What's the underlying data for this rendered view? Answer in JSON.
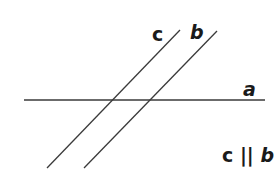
{
  "diagram": {
    "title": "",
    "lines": [
      {
        "name": "a",
        "x1": 24,
        "y1": 100,
        "x2": 265,
        "y2": 100
      },
      {
        "name": "c",
        "x1": 180,
        "y1": 30,
        "x2": 47,
        "y2": 168
      },
      {
        "name": "b",
        "x1": 217,
        "y1": 31,
        "x2": 84,
        "y2": 168
      }
    ],
    "labels": {
      "c": "c",
      "b": "b",
      "a": "a"
    },
    "relation": {
      "left": "c",
      "symbol": "||",
      "right": "b"
    },
    "line_color": "#3a3a3a",
    "text_color": "#1a1a1a"
  }
}
